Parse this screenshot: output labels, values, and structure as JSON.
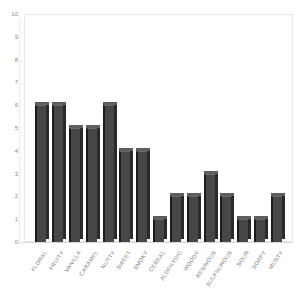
{
  "chart_data": {
    "type": "bar",
    "title": "",
    "subtitle": "",
    "xlabel": "",
    "ylabel": "",
    "ylim": [
      0,
      10
    ],
    "ytick_step": 1,
    "yticks": [
      10,
      9,
      8,
      7,
      6,
      5,
      4,
      3,
      2,
      1,
      0
    ],
    "grid": false,
    "legend": false,
    "legend_position": "none",
    "style": "3d-bar",
    "categories": [
      "FLORAL",
      "FRUITY",
      "VANILLA",
      "CARAMEL",
      "NUTTY",
      "SWEET",
      "SMOKY",
      "CEREAL",
      "ALDEHYDIC",
      "WOODY",
      "RESINOUS",
      "SULPHUROUS",
      "SOUR",
      "SOAPY",
      "MUSTY"
    ],
    "values": [
      6,
      6,
      5,
      5,
      6,
      4,
      4,
      1,
      2,
      2,
      3,
      2,
      1,
      1,
      2
    ],
    "colors": {
      "bar_face": "#474747",
      "bar_edge": "#1c1c1c",
      "bar_top": "#5e5e5e",
      "bar_side": "#2a2a2a",
      "axis_text": "#8a8a8a",
      "plot_border": "#e9e9e9",
      "background": "#ffffff"
    }
  }
}
